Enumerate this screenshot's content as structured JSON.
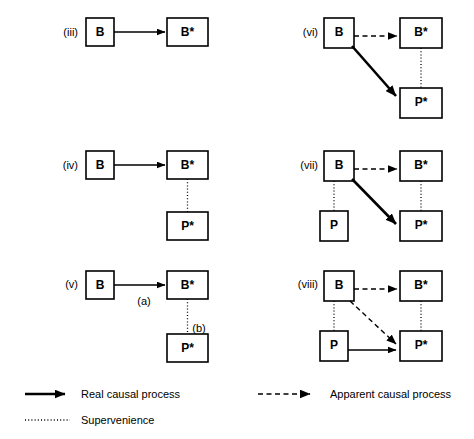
{
  "figure": {
    "panels": [
      {
        "id": "iii",
        "label": "(iii)",
        "nodes": [
          {
            "name": "B",
            "text": "B"
          },
          {
            "name": "B-star",
            "text": "B*"
          }
        ],
        "edges": [
          {
            "from": "B",
            "to": "B-star",
            "kind": "real causal process"
          }
        ]
      },
      {
        "id": "iv",
        "label": "(iv)",
        "nodes": [
          {
            "name": "B",
            "text": "B"
          },
          {
            "name": "B-star",
            "text": "B*"
          },
          {
            "name": "P-star",
            "text": "P*"
          }
        ],
        "edges": [
          {
            "from": "B",
            "to": "B-star",
            "kind": "real causal process"
          },
          {
            "from": "B-star",
            "to": "P-star",
            "kind": "supervenience"
          }
        ]
      },
      {
        "id": "v",
        "label": "(v)",
        "nodes": [
          {
            "name": "B",
            "text": "B"
          },
          {
            "name": "B-star",
            "text": "B*"
          },
          {
            "name": "P-star",
            "text": "P*"
          }
        ],
        "edges": [
          {
            "from": "B",
            "to": "B-star",
            "kind": "real causal process",
            "label": "(a)"
          },
          {
            "from": "B-star",
            "to": "P-star",
            "kind": "supervenience",
            "label": "(b)"
          }
        ],
        "edge_label_a": "(a)",
        "edge_label_b": "(b)"
      },
      {
        "id": "vi",
        "label": "(vi)",
        "nodes": [
          {
            "name": "B",
            "text": "B"
          },
          {
            "name": "B-star",
            "text": "B*"
          },
          {
            "name": "P-star",
            "text": "P*"
          }
        ],
        "edges": [
          {
            "from": "B",
            "to": "B-star",
            "kind": "apparent causal process"
          },
          {
            "from": "B",
            "to": "P-star",
            "kind": "real causal process"
          },
          {
            "from": "B-star",
            "to": "P-star",
            "kind": "supervenience"
          }
        ]
      },
      {
        "id": "vii",
        "label": "(vii)",
        "nodes": [
          {
            "name": "B",
            "text": "B"
          },
          {
            "name": "B-star",
            "text": "B*"
          },
          {
            "name": "P",
            "text": "P"
          },
          {
            "name": "P-star",
            "text": "P*"
          }
        ],
        "edges": [
          {
            "from": "B",
            "to": "B-star",
            "kind": "apparent causal process"
          },
          {
            "from": "B",
            "to": "P-star",
            "kind": "real causal process"
          },
          {
            "from": "B-star",
            "to": "P-star",
            "kind": "supervenience"
          },
          {
            "from": "P",
            "to": "B",
            "kind": "supervenience"
          }
        ]
      },
      {
        "id": "viii",
        "label": "(viii)",
        "nodes": [
          {
            "name": "B",
            "text": "B"
          },
          {
            "name": "B-star",
            "text": "B*"
          },
          {
            "name": "P",
            "text": "P"
          },
          {
            "name": "P-star",
            "text": "P*"
          }
        ],
        "edges": [
          {
            "from": "B",
            "to": "B-star",
            "kind": "apparent causal process"
          },
          {
            "from": "B",
            "to": "P-star",
            "kind": "apparent causal process"
          },
          {
            "from": "P",
            "to": "P-star",
            "kind": "real causal process"
          },
          {
            "from": "B-star",
            "to": "P-star",
            "kind": "supervenience"
          },
          {
            "from": "P",
            "to": "B",
            "kind": "supervenience"
          }
        ]
      }
    ]
  },
  "legend": {
    "items": [
      {
        "key": "real",
        "style": "solid-arrow",
        "label": "Real causal process"
      },
      {
        "key": "apparent",
        "style": "dashed-arrow",
        "label": "Apparent causal process"
      },
      {
        "key": "supervenience",
        "style": "dotted-line",
        "label": "Supervenience"
      }
    ]
  },
  "colors": {
    "ink": "#000000",
    "background": "#ffffff"
  }
}
